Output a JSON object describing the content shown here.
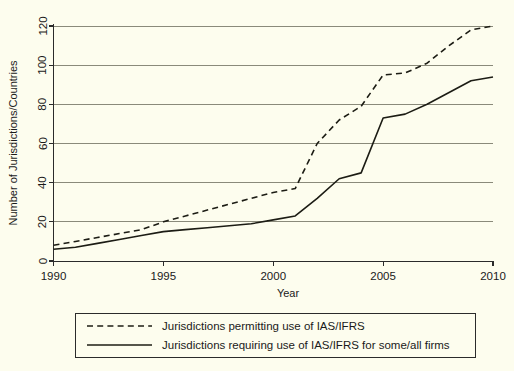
{
  "chart_data": {
    "type": "line",
    "title": "",
    "xlabel": "Year",
    "ylabel": "Number of Jurisdictions/Countries",
    "xlim": [
      1990,
      2010
    ],
    "ylim": [
      0,
      120
    ],
    "xticks": [
      1990,
      1995,
      2000,
      2005,
      2010
    ],
    "xtick_labels": [
      "1990",
      "1995",
      "2000",
      "2005",
      "2010"
    ],
    "yticks": [
      0,
      20,
      40,
      60,
      80,
      100,
      120
    ],
    "ytick_labels": [
      "0",
      "20",
      "40",
      "60",
      "80",
      "100",
      "120"
    ],
    "grid": "horizontal",
    "legend_position": "below-axes",
    "x": [
      1990,
      1991,
      1992,
      1993,
      1994,
      1995,
      1996,
      1997,
      1998,
      1999,
      2000,
      2001,
      2002,
      2003,
      2004,
      2005,
      2006,
      2007,
      2008,
      2009,
      2010
    ],
    "series": [
      {
        "name": "Jurisdictions permitting use of IAS/IFRS",
        "style": "dashed",
        "color": "#1c1c14",
        "values": [
          8,
          10,
          12,
          14,
          16,
          20,
          23,
          26,
          29,
          32,
          35,
          37,
          60,
          72,
          79,
          95,
          96,
          101,
          110,
          118,
          120
        ]
      },
      {
        "name": "Jurisdictions requiring use of IAS/IFRS for some/all firms",
        "style": "solid",
        "color": "#1c1c14",
        "values": [
          6,
          7,
          9,
          11,
          13,
          15,
          16,
          17,
          18,
          19,
          21,
          23,
          32,
          42,
          45,
          73,
          75,
          80,
          86,
          92,
          94
        ]
      }
    ]
  },
  "axis": {
    "x_title": "Year",
    "y_title": "Number of Jurisdictions/Countries"
  },
  "legend": {
    "items": [
      {
        "label": "Jurisdictions permitting use of IAS/IFRS",
        "style": "dashed"
      },
      {
        "label": "Jurisdictions requiring use of IAS/IFRS for some/all firms",
        "style": "solid"
      }
    ]
  },
  "colors": {
    "background": "#fdfdee",
    "ink": "#1c1c14",
    "grid": "#8a8a7a"
  }
}
